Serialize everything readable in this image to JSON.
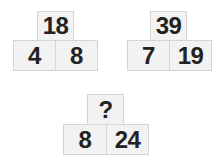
{
  "puzzles": [
    {
      "top": "18",
      "left": "4",
      "right": "8"
    },
    {
      "top": "39",
      "left": "7",
      "right": "19"
    },
    {
      "top": "?",
      "left": "8",
      "right": "24"
    }
  ]
}
